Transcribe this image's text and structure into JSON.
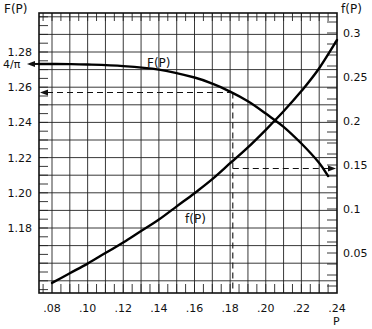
{
  "chart_data": {
    "type": "line",
    "title": "",
    "xlabel": "P",
    "ylabel_left": "F(P)",
    "ylabel_right": "f(P)",
    "xlim": [
      0.073,
      0.24
    ],
    "ylim_left": [
      1.143,
      1.302
    ],
    "ylim_right": [
      0.0,
      0.318
    ],
    "grid": true,
    "x_ticks": [
      ".08",
      ".10",
      ".12",
      ".14",
      ".16",
      ".18",
      ".20",
      ".22",
      ".24"
    ],
    "x_tick_values": [
      0.08,
      0.1,
      0.12,
      0.14,
      0.16,
      0.18,
      0.2,
      0.22,
      0.24
    ],
    "y_left_ticks": [
      "1.28",
      "1.26",
      "1.24",
      "1.22",
      "1.20",
      "1.18"
    ],
    "y_left_tick_values": [
      1.28,
      1.26,
      1.24,
      1.22,
      1.2,
      1.18
    ],
    "y_left_special_label": {
      "text": "4/π",
      "value": 1.2732
    },
    "y_right_ticks": [
      "0.3",
      "0.25",
      "0.2",
      "0.15",
      "0.1",
      "0.05"
    ],
    "y_right_tick_values": [
      0.3,
      0.25,
      0.2,
      0.15,
      0.1,
      0.05
    ],
    "series": [
      {
        "name": "F(P)",
        "axis": "left",
        "label": "F(P)",
        "x": [
          0.0727,
          0.09,
          0.1,
          0.12,
          0.14,
          0.16,
          0.17,
          0.18,
          0.19,
          0.2,
          0.21,
          0.22,
          0.23,
          0.235
        ],
        "y": [
          1.2732,
          1.2731,
          1.2729,
          1.272,
          1.27,
          1.2655,
          1.262,
          1.2575,
          1.252,
          1.245,
          1.2375,
          1.228,
          1.217,
          1.2095
        ]
      },
      {
        "name": "f(P)",
        "axis": "right",
        "label": "f(P)",
        "x": [
          0.08,
          0.09,
          0.1,
          0.11,
          0.12,
          0.13,
          0.14,
          0.15,
          0.16,
          0.17,
          0.18,
          0.19,
          0.2,
          0.21,
          0.22,
          0.23,
          0.24
        ],
        "y": [
          0.016,
          0.027,
          0.038,
          0.05,
          0.062,
          0.075,
          0.088,
          0.103,
          0.118,
          0.134,
          0.152,
          0.17,
          0.19,
          0.211,
          0.234,
          0.26,
          0.292
        ]
      }
    ],
    "annotations": [
      {
        "type": "arrow",
        "text": "4/π",
        "axis": "left",
        "value": 1.2732,
        "direction": "left"
      },
      {
        "type": "dashed-vline",
        "x": 0.1815
      },
      {
        "type": "dashed-hline-arrow",
        "axis": "left",
        "value": 1.257,
        "from_x": 0.1815,
        "direction": "left"
      },
      {
        "type": "dashed-hline-arrow",
        "axis": "right",
        "value": 0.146,
        "from_x": 0.1815,
        "direction": "right"
      }
    ]
  }
}
